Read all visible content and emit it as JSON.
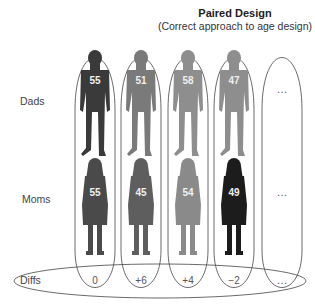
{
  "title": "Paired Design",
  "subtitle": "(Correct approach to age design)",
  "row_labels": {
    "dads": "Dads",
    "moms": "Moms",
    "diffs": "Diffs"
  },
  "pairs": [
    {
      "dad_age": "55",
      "mom_age": "55",
      "diff": "0",
      "dad_color": "#3a3a3a",
      "mom_color": "#4a4a4a"
    },
    {
      "dad_age": "51",
      "mom_age": "45",
      "diff": "+6",
      "dad_color": "#7a7a7a",
      "mom_color": "#5e5e5e"
    },
    {
      "dad_age": "58",
      "mom_age": "54",
      "diff": "+4",
      "dad_color": "#8e8e8e",
      "mom_color": "#8a8a8a"
    },
    {
      "dad_age": "47",
      "mom_age": "49",
      "diff": "−2",
      "dad_color": "#8e8e8e",
      "mom_color": "#1c1c1c"
    }
  ],
  "ellipsis": "…",
  "ellipsis_column": {
    "dads": "…",
    "moms": "…",
    "diffs": "…"
  }
}
